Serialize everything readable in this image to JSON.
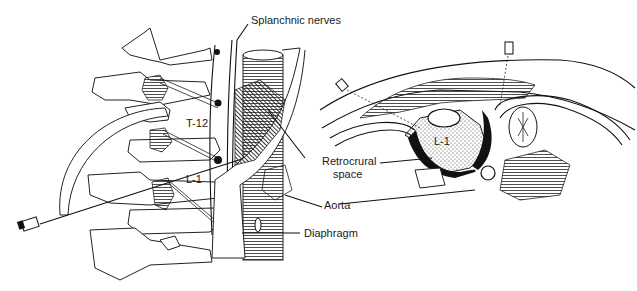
{
  "figure": {
    "labels": {
      "splanchnic_nerves": "Splanchnic nerves",
      "t12": "T-12",
      "l1_left": "L-1",
      "l1_right": "L-1",
      "retrocrural_line1": "Retrocrural",
      "retrocrural_line2": "space",
      "aorta": "Aorta",
      "diaphragm": "Diaphragm"
    },
    "colors": {
      "ink": "#111111",
      "background": "#ffffff"
    }
  }
}
